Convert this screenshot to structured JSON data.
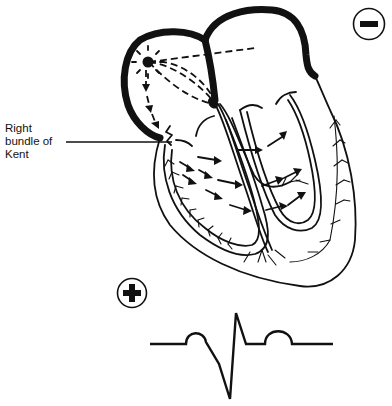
{
  "diagram": {
    "annotation": {
      "label": "Right\nbundle of\nKent"
    },
    "electrodes": {
      "negative": {
        "symbol": "minus",
        "polarity": "negative"
      },
      "positive": {
        "symbol": "plus",
        "polarity": "positive"
      }
    },
    "nodes": [
      "sinoatrial-node",
      "atrioventricular-node"
    ],
    "ecg": {
      "description": "Negative delta wave with short PR interval, QRS predominantly negative",
      "waves": [
        "P",
        "delta-QRS",
        "T"
      ]
    }
  }
}
